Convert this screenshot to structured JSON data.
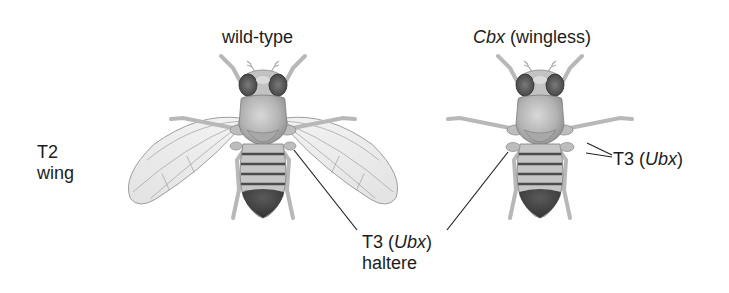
{
  "figure": {
    "panels": [
      {
        "id": "wild-type",
        "title": "wild-type",
        "has_wings": true
      },
      {
        "id": "cbx",
        "title_italic": "Cbx",
        "title_rest": " (wingless)",
        "has_wings": false
      }
    ],
    "labels": {
      "t2_line1": "T2",
      "t2_line2": "wing",
      "haltere_prefix": "T3 (",
      "haltere_gene": "Ubx",
      "haltere_suffix": ")",
      "haltere_line2": "haltere",
      "cbx_t3_prefix": "T3 (",
      "cbx_t3_gene": "Ubx",
      "cbx_t3_suffix": ")"
    },
    "colors": {
      "background": "#ffffff",
      "text": "#1c1c1c",
      "body_light": "#c9c9c9",
      "body_mid": "#a8a8a8",
      "abdomen_dark": "#4a4a4a",
      "wing_fill": "#ededed",
      "wing_vein": "#9a9a9a",
      "leader_line": "#222222"
    }
  }
}
